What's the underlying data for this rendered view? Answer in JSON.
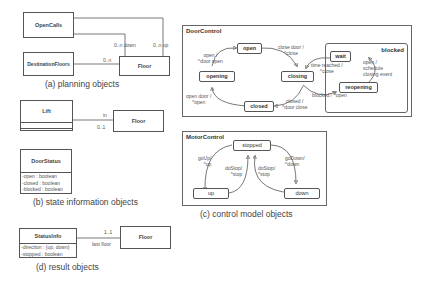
{
  "planning": {
    "caption": "(a) planning objects",
    "open_calls": "OpenCalls",
    "destination_floors": "DestinationFloors",
    "floor": "Floor",
    "mult_down": "0..n down",
    "mult_up": "0..n up",
    "mult_dest": "0..n"
  },
  "state_info": {
    "caption": "(b) state information objects",
    "lift": "Lift",
    "floor": "Floor",
    "role_in": "in",
    "mult_in": "0..1",
    "door_status": {
      "title": "DoorStatus",
      "attributes": [
        "-open : boolean",
        "-closed : boolean",
        "-blocked : boolean"
      ]
    }
  },
  "result": {
    "caption": "(d) result objects",
    "status_info": {
      "title": "StatusInfo",
      "attributes": [
        "-direction : {up, down}",
        "-stopped : boolean"
      ]
    },
    "floor": "Floor",
    "mult": "1..1",
    "role": "last floor"
  },
  "control": {
    "caption": "(c) control model objects",
    "door_control": {
      "title": "DoorControl",
      "states": {
        "open": "open",
        "opening": "opening",
        "closing": "closing",
        "closed": "closed",
        "blocked": "blocked",
        "wait": "wait",
        "reopening": "reopening"
      },
      "transitions": {
        "opening_to_open": [
          "open /",
          "^door open"
        ],
        "open_to_closing": [
          "close door /",
          "^close"
        ],
        "closing_to_closed": [
          "closed /",
          "^door close"
        ],
        "closed_to_opening": [
          "open door /",
          "^open"
        ],
        "wait_to_closing": [
          "time reached /",
          "^close"
        ],
        "closing_to_reopening": "blocked / ^open",
        "reopening_to_wait": [
          "open /",
          "schedule",
          "closing event"
        ]
      }
    },
    "motor_control": {
      "title": "MotorControl",
      "states": {
        "stopped": "stopped",
        "up": "up",
        "down": "down"
      },
      "transitions": {
        "stopped_to_up": [
          "goUp/",
          "^up"
        ],
        "up_to_stopped": [
          "doStop/",
          "^stop"
        ],
        "down_to_stopped": [
          "doStop/",
          "^stop"
        ],
        "stopped_to_down": [
          "goDown/",
          "^down"
        ]
      }
    }
  }
}
